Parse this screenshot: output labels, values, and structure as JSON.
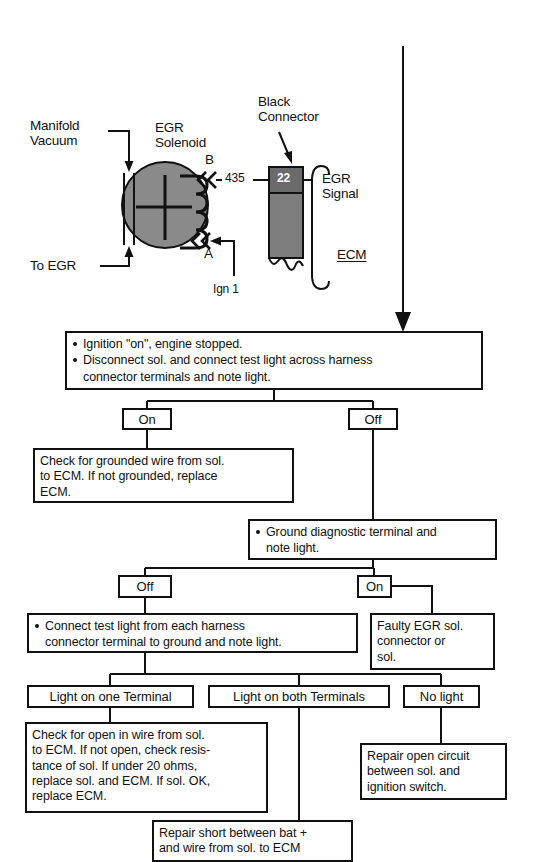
{
  "schematic": {
    "labels": {
      "manifold_vacuum": "Manifold\nVacuum",
      "to_egr": "To EGR",
      "egr_solenoid": "EGR\nSolenoid",
      "black_connector": "Black\nConnector",
      "terminal_b": "B",
      "terminal_a": "A",
      "circuit_435": "435",
      "pin_22": "22",
      "egr_signal": "EGR\nSignal",
      "ecm": "ECM",
      "ign_1": "Ign 1"
    },
    "colors": {
      "solenoid_fill": "#8a8a8a",
      "connector_fill": "#7d7d7d",
      "terminal_fill": "#6b6b6b",
      "line": "#111111"
    }
  },
  "flowchart": {
    "step1": {
      "line1": "Ignition \"on\", engine stopped.",
      "line2": "Disconnect sol. and connect test light across harness",
      "line3": "connector terminals and note light."
    },
    "branch1": {
      "on": "On",
      "off": "Off"
    },
    "check_grounded": {
      "line1": "Check for grounded wire from sol.",
      "line2": "to ECM. If not grounded, replace",
      "line3": "ECM."
    },
    "ground_diag": {
      "line1": "Ground diagnostic terminal and",
      "line2": "note light."
    },
    "branch2": {
      "off": "Off",
      "on": "On"
    },
    "connect_test_light": {
      "line1": "Connect test light from each harness",
      "line2": "connector terminal to ground and note light."
    },
    "faulty_egr": {
      "line1": "Faulty EGR sol.",
      "line2": "connector or",
      "line3": "sol."
    },
    "branch3": {
      "one_terminal": "Light on one Terminal",
      "both_terminals": "Light on both Terminals",
      "no_light": "No light"
    },
    "check_open": {
      "line1": "Check for open in wire from sol.",
      "line2": "to ECM. If not open, check resis-",
      "line3": "tance of sol. If under 20 ohms,",
      "line4": "replace sol. and ECM. If sol. OK,",
      "line5": "replace ECM."
    },
    "repair_open": {
      "line1": "Repair open circuit",
      "line2": "between sol. and",
      "line3": "ignition switch."
    },
    "repair_short": {
      "line1": "Repair short between bat +",
      "line2": "and wire from sol. to ECM"
    }
  }
}
